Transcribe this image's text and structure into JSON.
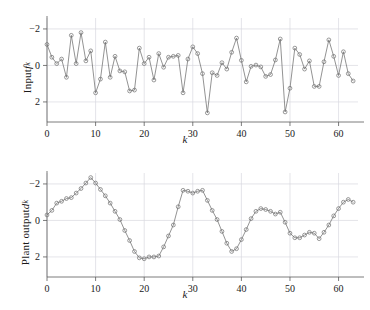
{
  "figure": {
    "background": "#ffffff",
    "line_color": "#6f6f6f",
    "grid_color": "#d8d8e0",
    "axis_color": "#5a5a5a"
  },
  "panels": [
    {
      "id": "input",
      "ylabel_prefix": "Input ",
      "ylabel_var": "f",
      "ylabel_sub": "k",
      "xlabel": "k",
      "yticks": [
        "2",
        "0",
        "−2"
      ],
      "xticks": [
        "0",
        "10",
        "20",
        "30",
        "40",
        "50",
        "60"
      ]
    },
    {
      "id": "output",
      "ylabel_prefix": "Plant output ",
      "ylabel_var": "d",
      "ylabel_sub": "k",
      "xlabel": "k",
      "yticks": [
        "2",
        "0",
        "−2"
      ],
      "xticks": [
        "0",
        "10",
        "20",
        "30",
        "40",
        "50",
        "60"
      ]
    }
  ],
  "chart_data": [
    {
      "type": "line",
      "id": "input-signal",
      "title": "",
      "xlabel": "k",
      "ylabel": "Input f_k",
      "xlim": [
        0,
        64
      ],
      "ylim": [
        -3.1,
        2.6
      ],
      "xticks": [
        0,
        10,
        20,
        30,
        40,
        50,
        60
      ],
      "yticks": [
        -2,
        0,
        2
      ],
      "grid": true,
      "markers": "open-circle",
      "legend": "none",
      "x": [
        0,
        1,
        2,
        3,
        4,
        5,
        6,
        7,
        8,
        9,
        10,
        11,
        12,
        13,
        14,
        15,
        16,
        17,
        18,
        19,
        20,
        21,
        22,
        23,
        24,
        25,
        26,
        27,
        28,
        29,
        30,
        31,
        32,
        33,
        34,
        35,
        36,
        37,
        38,
        39,
        40,
        41,
        42,
        43,
        44,
        45,
        46,
        47,
        48,
        49,
        50,
        51,
        52,
        53,
        54,
        55,
        56,
        57,
        58,
        59,
        60,
        61,
        62,
        63
      ],
      "values": [
        1.15,
        0.45,
        0.1,
        0.35,
        -0.65,
        1.65,
        0.1,
        1.8,
        0.25,
        0.8,
        -1.5,
        -0.75,
        1.28,
        -0.65,
        0.5,
        -0.3,
        -0.35,
        -1.4,
        -1.35,
        0.95,
        0.1,
        0.45,
        -0.8,
        0.65,
        -0.1,
        0.45,
        0.5,
        0.55,
        -1.5,
        0.35,
        1.02,
        0.65,
        -0.45,
        -2.6,
        -0.4,
        -0.55,
        0.15,
        -0.2,
        0.72,
        1.5,
        0.28,
        -0.9,
        -0.05,
        0.02,
        -0.08,
        -0.6,
        -0.5,
        0.3,
        1.45,
        -2.55,
        -1.25,
        0.95,
        0.6,
        -0.2,
        0.25,
        -1.15,
        -1.15,
        0.2,
        1.4,
        0.5,
        -0.55,
        0.75,
        -0.45,
        -0.85
      ]
    },
    {
      "type": "line",
      "id": "plant-output-signal",
      "title": "",
      "xlabel": "k",
      "ylabel": "Plant output d_k",
      "xlim": [
        0,
        64
      ],
      "ylim": [
        -3.1,
        2.6
      ],
      "xticks": [
        0,
        10,
        20,
        30,
        40,
        50,
        60
      ],
      "yticks": [
        -2,
        0,
        2
      ],
      "grid": true,
      "markers": "open-circle",
      "legend": "none",
      "x": [
        0,
        1,
        2,
        3,
        4,
        5,
        6,
        7,
        8,
        9,
        10,
        11,
        12,
        13,
        14,
        15,
        16,
        17,
        18,
        19,
        20,
        21,
        22,
        23,
        24,
        25,
        26,
        27,
        28,
        29,
        30,
        31,
        32,
        33,
        34,
        35,
        36,
        37,
        38,
        39,
        40,
        41,
        42,
        43,
        44,
        45,
        46,
        47,
        48,
        49,
        50,
        51,
        52,
        53,
        54,
        55,
        56,
        57,
        58,
        59,
        60,
        61,
        62,
        63
      ],
      "values": [
        0.3,
        0.55,
        0.95,
        1.05,
        1.2,
        1.25,
        1.5,
        1.75,
        2.05,
        2.35,
        2.05,
        1.7,
        1.35,
        0.95,
        0.5,
        0.05,
        -0.55,
        -1.1,
        -1.7,
        -2.05,
        -2.1,
        -2.0,
        -2.0,
        -1.95,
        -1.45,
        -0.85,
        -0.25,
        0.75,
        1.65,
        1.6,
        1.5,
        1.6,
        1.65,
        1.1,
        0.55,
        0.05,
        -0.6,
        -1.25,
        -1.7,
        -1.55,
        -1.05,
        -0.5,
        0.1,
        0.5,
        0.65,
        0.6,
        0.5,
        0.35,
        0.45,
        -0.1,
        -0.7,
        -0.95,
        -0.95,
        -0.8,
        -0.65,
        -0.7,
        -1.0,
        -0.65,
        -0.25,
        0.25,
        0.65,
        1.0,
        1.15,
        1.0
      ]
    }
  ]
}
